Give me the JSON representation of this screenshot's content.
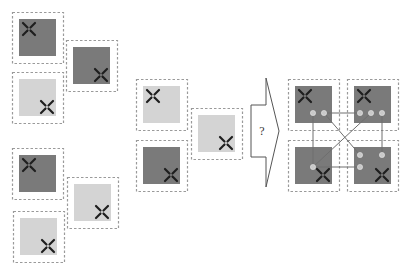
{
  "colors": {
    "dark_tile": "#7a7a7a",
    "light_tile": "#d4d4d4",
    "dashed_border": "#9a9a9a",
    "cross": "#1e1e1e",
    "link_line": "#6e6e6e",
    "dot": "#c9c9c9",
    "arrow_stroke": "#555555"
  },
  "left_group": {
    "tiles": [
      {
        "id": "L1",
        "x": 12,
        "y": 12,
        "shade": "dark",
        "cross": "top-left"
      },
      {
        "id": "L2",
        "x": 66,
        "y": 40,
        "shade": "dark",
        "cross": "bottom-right"
      },
      {
        "id": "L3",
        "x": 12,
        "y": 72,
        "shade": "light",
        "cross": "bottom-right"
      },
      {
        "id": "L4",
        "x": 12,
        "y": 148,
        "shade": "dark",
        "cross": "top-left"
      },
      {
        "id": "L5",
        "x": 67,
        "y": 177,
        "shade": "light",
        "cross": "bottom-right"
      },
      {
        "id": "L6",
        "x": 13,
        "y": 211,
        "shade": "light",
        "cross": "bottom-right"
      }
    ]
  },
  "middle_group": {
    "tiles": [
      {
        "id": "M1",
        "x": 136,
        "y": 79,
        "shade": "light",
        "cross": "top-left"
      },
      {
        "id": "M2",
        "x": 191,
        "y": 108,
        "shade": "light",
        "cross": "bottom-right"
      },
      {
        "id": "M3",
        "x": 136,
        "y": 140,
        "shade": "dark",
        "cross": "bottom-right"
      }
    ]
  },
  "arrow": {
    "label": "?"
  },
  "right_group": {
    "tiles": [
      {
        "id": "R1",
        "x": 288,
        "y": 79,
        "shade": "dark",
        "cross": "top-left"
      },
      {
        "id": "R2",
        "x": 347,
        "y": 79,
        "shade": "dark",
        "cross": "top-left"
      },
      {
        "id": "R3",
        "x": 288,
        "y": 140,
        "shade": "dark",
        "cross": "bottom-right"
      },
      {
        "id": "R4",
        "x": 347,
        "y": 140,
        "shade": "dark",
        "cross": "bottom-right"
      }
    ],
    "dots": [
      [
        313,
        113
      ],
      [
        324,
        113
      ],
      [
        360,
        113
      ],
      [
        371,
        113
      ],
      [
        382,
        113
      ],
      [
        313,
        167
      ],
      [
        360,
        155
      ],
      [
        382,
        155
      ],
      [
        360,
        167
      ]
    ],
    "links": [
      [
        313,
        113,
        313,
        167
      ],
      [
        324,
        113,
        360,
        113
      ],
      [
        324,
        113,
        360,
        155
      ],
      [
        371,
        113,
        313,
        167
      ],
      [
        382,
        113,
        382,
        155
      ],
      [
        313,
        167,
        360,
        167
      ]
    ]
  }
}
